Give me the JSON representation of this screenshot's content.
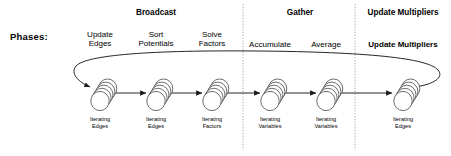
{
  "diagram": {
    "row_label": "Phases:",
    "groups": [
      {
        "id": "broadcast",
        "label": "Broadcast",
        "bold": true,
        "center_x": 156
      },
      {
        "id": "gather",
        "label": "Gather",
        "bold": true,
        "center_x": 300
      },
      {
        "id": "update-multipliers",
        "label": "Update Multipliers",
        "bold": true,
        "center_x": 403
      }
    ],
    "dividers": [
      {
        "id": "divider-broadcast-gather",
        "x": 243
      },
      {
        "id": "divider-gather-update",
        "x": 355
      }
    ],
    "phases": [
      {
        "id": "update-edges",
        "line1": "Update",
        "line2": "Edges",
        "bold": false,
        "x": 100,
        "caption1": "Iterating",
        "caption2": "Edges"
      },
      {
        "id": "sort-potentials",
        "line1": "Sort",
        "line2": "Potentials",
        "bold": false,
        "x": 156,
        "caption1": "Iterating",
        "caption2": "Edges"
      },
      {
        "id": "solve-factors",
        "line1": "Solve",
        "line2": "Factors",
        "bold": false,
        "x": 212,
        "caption1": "Iterating",
        "caption2": "Factors"
      },
      {
        "id": "accumulate",
        "line1": "Accumulate",
        "line2": "",
        "bold": false,
        "x": 270,
        "caption1": "Iterating",
        "caption2": "Variables"
      },
      {
        "id": "average",
        "line1": "Average",
        "line2": "",
        "bold": false,
        "x": 326,
        "caption1": "Iterating",
        "caption2": "Variables"
      },
      {
        "id": "update-multipliers",
        "line1": "Update Multipliers",
        "line2": "",
        "bold": true,
        "x": 403,
        "caption1": "Iterating",
        "caption2": "Edges"
      }
    ],
    "colors": {
      "stroke": "#1a1a1a",
      "stack_stroke": "#3c3c3c",
      "divider": "#9a9a9a",
      "background": "#ffffff"
    },
    "flow": {
      "arrow_label": "sequence-arrow",
      "feedback_loop_label": "feedback-loop-arrow"
    }
  }
}
